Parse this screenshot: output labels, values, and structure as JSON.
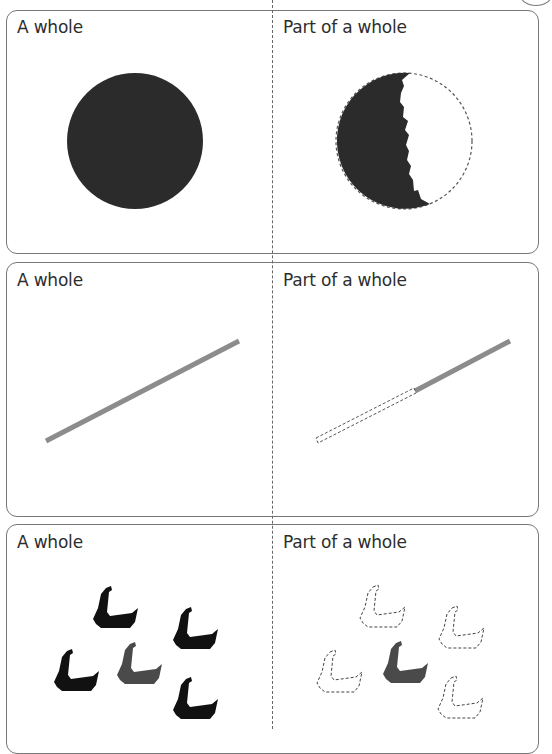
{
  "panels": [
    {
      "id": "circle",
      "left_label": "A whole",
      "right_label": "Part of a whole",
      "left_figure": "whole-circle",
      "right_figure": "torn-circle-with-dashed-missing-part"
    },
    {
      "id": "line",
      "left_label": "A whole",
      "right_label": "Part of a whole",
      "left_figure": "whole-line-segment",
      "right_figure": "partial-line-segment-with-dashed-missing-part"
    },
    {
      "id": "ducks",
      "left_label": "A whole",
      "right_label": "Part of a whole",
      "left_figure": "group-of-five-ducks",
      "right_figure": "one-duck-shown-four-dashed-outlines"
    }
  ],
  "colors": {
    "dark_fill": "#2b2b2b",
    "line_grey": "#8c8c8c",
    "duck_black": "#111111",
    "duck_grey": "#4a4a4a",
    "border": "#777777",
    "text": "#2d2d2d"
  }
}
